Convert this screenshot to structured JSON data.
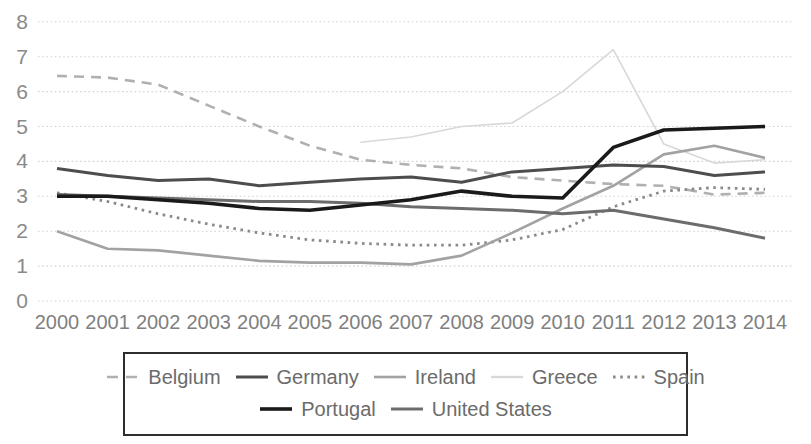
{
  "chart_data": {
    "type": "line",
    "title": "",
    "xlabel": "",
    "ylabel": "",
    "x": [
      2000,
      2001,
      2002,
      2003,
      2004,
      2005,
      2006,
      2007,
      2008,
      2009,
      2010,
      2011,
      2012,
      2013,
      2014
    ],
    "ylim": [
      0,
      8
    ],
    "yticks": [
      0,
      1,
      2,
      3,
      4,
      5,
      6,
      7,
      8
    ],
    "grid": true,
    "gridline_color": "#d2d2d2",
    "legend_position": "bottom",
    "series": [
      {
        "name": "Belgium",
        "color": "#b0b0b0",
        "style": "dashed",
        "width": 2.6,
        "values": [
          6.45,
          6.4,
          6.2,
          5.6,
          5.0,
          4.45,
          4.05,
          3.9,
          3.8,
          3.55,
          3.45,
          3.35,
          3.3,
          3.05,
          3.1
        ]
      },
      {
        "name": "Germany",
        "color": "#4d4d4d",
        "style": "solid",
        "width": 3.0,
        "values": [
          3.8,
          3.6,
          3.45,
          3.5,
          3.3,
          3.4,
          3.5,
          3.55,
          3.4,
          3.7,
          3.8,
          3.9,
          3.85,
          3.6,
          3.7
        ]
      },
      {
        "name": "Ireland",
        "color": "#a2a2a2",
        "style": "solid",
        "width": 2.6,
        "values": [
          2.0,
          1.5,
          1.45,
          1.3,
          1.15,
          1.1,
          1.1,
          1.05,
          1.3,
          1.95,
          2.65,
          3.3,
          4.2,
          4.45,
          4.1
        ]
      },
      {
        "name": "Greece",
        "color": "#d8d8d8",
        "style": "solid",
        "width": 1.6,
        "values": [
          null,
          null,
          null,
          null,
          null,
          null,
          4.55,
          4.7,
          5.0,
          5.1,
          6.0,
          7.2,
          4.5,
          3.95,
          4.05
        ]
      },
      {
        "name": "Spain",
        "color": "#8a8a8a",
        "style": "dotted",
        "width": 2.8,
        "values": [
          3.1,
          2.85,
          2.5,
          2.2,
          1.95,
          1.75,
          1.65,
          1.6,
          1.6,
          1.75,
          2.05,
          2.7,
          3.15,
          3.25,
          3.2
        ]
      },
      {
        "name": "Portugal",
        "color": "#1a1a1a",
        "style": "solid",
        "width": 3.6,
        "values": [
          3.0,
          3.0,
          2.9,
          2.8,
          2.65,
          2.6,
          2.75,
          2.9,
          3.15,
          3.0,
          2.95,
          4.4,
          4.9,
          4.95,
          5.0
        ]
      },
      {
        "name": "United States",
        "color": "#6c6c6c",
        "style": "solid",
        "width": 3.0,
        "values": [
          3.05,
          3.0,
          2.95,
          2.9,
          2.85,
          2.85,
          2.8,
          2.7,
          2.65,
          2.6,
          2.5,
          2.6,
          2.35,
          2.1,
          1.8
        ]
      }
    ],
    "draw_order": [
      "Greece",
      "Belgium",
      "Spain",
      "Ireland",
      "United States",
      "Germany",
      "Portugal"
    ],
    "legend_rows": [
      [
        "Belgium",
        "Germany",
        "Ireland",
        "Greece",
        "Spain"
      ],
      [
        "Portugal",
        "United States"
      ]
    ]
  }
}
